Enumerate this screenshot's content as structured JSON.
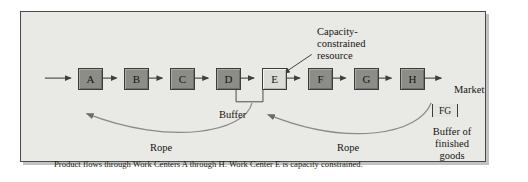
{
  "figure": {
    "title_caption": "Product flows through Work Centers A through H. Work Center E is capacity constrained.",
    "nodes": [
      {
        "id": "A",
        "label": "A",
        "constrained": false
      },
      {
        "id": "B",
        "label": "B",
        "constrained": false
      },
      {
        "id": "C",
        "label": "C",
        "constrained": false
      },
      {
        "id": "D",
        "label": "D",
        "constrained": false
      },
      {
        "id": "E",
        "label": "E",
        "constrained": true
      },
      {
        "id": "F",
        "label": "F",
        "constrained": false
      },
      {
        "id": "G",
        "label": "G",
        "constrained": false
      },
      {
        "id": "H",
        "label": "H",
        "constrained": false
      }
    ],
    "annotations": {
      "capacity_constrained": "Capacity-constrained resource",
      "market": "Market",
      "buffer": "Buffer",
      "rope_left": "Rope",
      "rope_right": "Rope",
      "fg_box": "FG",
      "fg_buffer": "Buffer of finished goods"
    },
    "colors": {
      "panel_background": "#e9e9e6",
      "node_fill": "#8d8d88",
      "constrained_node_fill": "#dcdcd6",
      "line": "#4a4a48",
      "frame_border": "#4a4a48",
      "text": "#16160f"
    }
  }
}
